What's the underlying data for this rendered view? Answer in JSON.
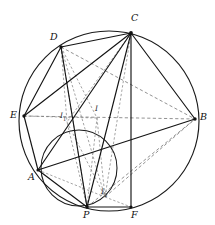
{
  "figure": {
    "canvas": {
      "width": 215,
      "height": 225
    },
    "outer_circle": {
      "cx": 109,
      "cy": 121,
      "r": 90,
      "label": "circumcircle"
    },
    "inner_circle": {
      "cx": 79,
      "cy": 168,
      "r": 38,
      "label": "mixtilinear-circle"
    },
    "points": [
      {
        "id": "C",
        "label": "C",
        "x": 131,
        "y": 33,
        "lx": 131,
        "ly": 13,
        "dot": true,
        "kind": "vertex"
      },
      {
        "id": "D",
        "label": "D",
        "x": 61,
        "y": 47,
        "lx": 50,
        "ly": 32,
        "dot": true,
        "kind": "vertex"
      },
      {
        "id": "E",
        "label": "E",
        "x": 24,
        "y": 116,
        "lx": 10,
        "ly": 110,
        "dot": true,
        "kind": "vertex"
      },
      {
        "id": "B",
        "label": "B",
        "x": 195,
        "y": 119,
        "lx": 200,
        "ly": 112,
        "dot": true,
        "kind": "vertex"
      },
      {
        "id": "A",
        "label": "A",
        "x": 38,
        "y": 170,
        "lx": 28,
        "ly": 172,
        "dot": true,
        "kind": "vertex"
      },
      {
        "id": "P",
        "label": "P",
        "x": 87,
        "y": 207,
        "lx": 83,
        "ly": 210,
        "dot": true,
        "kind": "vertex"
      },
      {
        "id": "F",
        "label": "F",
        "x": 131,
        "y": 207,
        "lx": 131,
        "ly": 210,
        "dot": true,
        "kind": "vertex"
      },
      {
        "id": "I",
        "label": "I",
        "x": 97,
        "y": 118,
        "lx": 95,
        "ly": 107,
        "dot": false,
        "kind": "incenter"
      },
      {
        "id": "I1",
        "label": "I",
        "sub": "1",
        "x": 67,
        "y": 122,
        "lx": 60,
        "ly": 114,
        "dot": false,
        "kind": "incenter"
      },
      {
        "id": "I2",
        "label": "I",
        "sub": "2",
        "x": 105,
        "y": 197,
        "lx": 101,
        "ly": 190,
        "dot": false,
        "kind": "incenter"
      }
    ],
    "solid_segments": [
      [
        "D",
        "C"
      ],
      [
        "D",
        "E"
      ],
      [
        "D",
        "P"
      ],
      [
        "C",
        "E"
      ],
      [
        "C",
        "B"
      ],
      [
        "C",
        "A"
      ],
      [
        "C",
        "P"
      ],
      [
        "C",
        "F"
      ],
      [
        "E",
        "A"
      ],
      [
        "E",
        "B"
      ],
      [
        "A",
        "B"
      ],
      [
        "A",
        "P"
      ],
      [
        "P",
        "F"
      ]
    ],
    "dashed_segments": [
      [
        "D",
        "I"
      ],
      [
        "D",
        "I1"
      ],
      [
        "D",
        "I2"
      ],
      [
        "D",
        "P"
      ],
      [
        "E",
        "B"
      ],
      [
        "E",
        "I"
      ],
      [
        "C",
        "I1"
      ],
      [
        "C",
        "I2"
      ],
      [
        "P",
        "B"
      ],
      [
        "P",
        "I"
      ],
      [
        "P",
        "I1"
      ],
      [
        "I",
        "I2"
      ],
      [
        "I1",
        "I2"
      ],
      [
        "A",
        "I2"
      ],
      [
        "I2",
        "B"
      ],
      [
        "I2",
        "F"
      ],
      [
        "D",
        "B"
      ]
    ],
    "colors": {
      "stroke_solid": "#141414",
      "stroke_dashed": "#6e6e6e",
      "background": "#ffffff",
      "label": "#101010"
    }
  }
}
